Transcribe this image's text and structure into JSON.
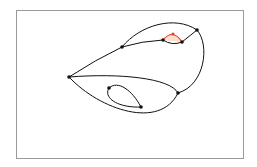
{
  "diagram": {
    "type": "graph-drawing",
    "frame": {
      "x": 16,
      "y": 10,
      "width": 227,
      "height": 148,
      "stroke": "#9a9a9a"
    },
    "colors": {
      "edge": "#111111",
      "node": "#111111",
      "highlight_edge": "#e8402a",
      "highlight_fill": "#f6c9a8"
    },
    "nodes": [
      {
        "id": "A",
        "x": 69,
        "y": 77
      },
      {
        "id": "B",
        "x": 122,
        "y": 47
      },
      {
        "id": "C",
        "x": 163,
        "y": 40
      },
      {
        "id": "D",
        "x": 182,
        "y": 42
      },
      {
        "id": "E",
        "x": 197,
        "y": 30
      },
      {
        "id": "F",
        "x": 178,
        "y": 93
      },
      {
        "id": "G",
        "x": 109,
        "y": 88
      },
      {
        "id": "H",
        "x": 141,
        "y": 107
      },
      {
        "id": "R",
        "x": 173,
        "y": 34,
        "highlight": true
      }
    ],
    "edges": [
      {
        "from": "A",
        "to": "B",
        "path": "M69,77 Q95,60 122,47"
      },
      {
        "from": "B",
        "to": "E",
        "path": "M122,47 C140,25 175,15 197,30"
      },
      {
        "from": "B",
        "to": "C",
        "path": "M122,47 Q142,41 163,40"
      },
      {
        "from": "C",
        "to": "D",
        "path": "M163,40 Q172,46 182,42"
      },
      {
        "from": "D",
        "to": "E",
        "path": "M182,42 L197,30"
      },
      {
        "from": "E",
        "to": "F",
        "path": "M197,30 C210,45 205,85 178,93"
      },
      {
        "from": "A",
        "to": "F",
        "path": "M69,77 C120,73 170,78 178,93"
      },
      {
        "from": "A",
        "to": "F",
        "path": "M69,77 C100,110 160,130 178,93"
      },
      {
        "from": "G",
        "to": "H",
        "path": "M109,88 C118,80 132,90 141,107"
      },
      {
        "from": "G",
        "to": "H",
        "path": "M109,88 C103,98 118,108 141,107"
      },
      {
        "from": "C",
        "to": "D",
        "path": "M163,40 Q173,28 182,42",
        "highlight": true
      }
    ]
  }
}
